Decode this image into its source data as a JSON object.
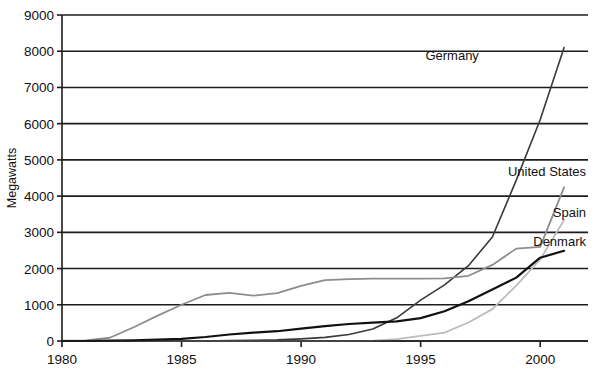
{
  "chart_data": {
    "type": "line",
    "title": "",
    "xlabel": "",
    "ylabel": "Megawatts",
    "xlim": [
      1980,
      2002
    ],
    "ylim": [
      0,
      9000
    ],
    "grid": true,
    "legend_position": "inline-right-labels",
    "x_ticks": [
      "1980",
      "1985",
      "1990",
      "1995",
      "2000"
    ],
    "x_tick_values": [
      1980,
      1985,
      1990,
      1995,
      2000
    ],
    "y_ticks": [
      "0",
      "1000",
      "2000",
      "3000",
      "4000",
      "5000",
      "6000",
      "7000",
      "8000",
      "9000"
    ],
    "y_tick_values": [
      0,
      1000,
      2000,
      3000,
      4000,
      5000,
      6000,
      7000,
      8000,
      9000
    ],
    "x": [
      1980,
      1981,
      1982,
      1983,
      1984,
      1985,
      1986,
      1987,
      1988,
      1989,
      1990,
      1991,
      1992,
      1993,
      1994,
      1995,
      1996,
      1997,
      1998,
      1999,
      2000,
      2001
    ],
    "series": [
      {
        "name": "Germany",
        "color": "#3a3a3a",
        "width": 1.6,
        "label_x": 1995.2,
        "label_y": 7750,
        "values": [
          0,
          0,
          0,
          0,
          0,
          0,
          0,
          10,
          20,
          30,
          60,
          100,
          180,
          330,
          640,
          1130,
          1550,
          2080,
          2870,
          4440,
          6110,
          8100
        ]
      },
      {
        "name": "United States",
        "color": "#8d8d8d",
        "width": 1.8,
        "label_x": 2001.8,
        "label_y": 4550,
        "values": [
          10,
          20,
          90,
          380,
          700,
          1000,
          1270,
          1330,
          1250,
          1320,
          1520,
          1680,
          1710,
          1720,
          1720,
          1720,
          1730,
          1800,
          2100,
          2550,
          2600,
          4240
        ]
      },
      {
        "name": "Spain",
        "color": "#bcbcbc",
        "width": 1.8,
        "label_x": 2001.8,
        "label_y": 3420,
        "values": [
          0,
          0,
          0,
          0,
          0,
          0,
          0,
          0,
          0,
          0,
          0,
          0,
          0,
          10,
          50,
          140,
          230,
          510,
          880,
          1530,
          2250,
          3340
        ]
      },
      {
        "name": "Denmark",
        "color": "#111111",
        "width": 2.2,
        "label_x": 2001.8,
        "label_y": 2620,
        "values": [
          0,
          0,
          10,
          20,
          40,
          60,
          110,
          180,
          230,
          270,
          340,
          410,
          470,
          510,
          540,
          630,
          820,
          1100,
          1420,
          1750,
          2300,
          2490
        ]
      }
    ]
  }
}
